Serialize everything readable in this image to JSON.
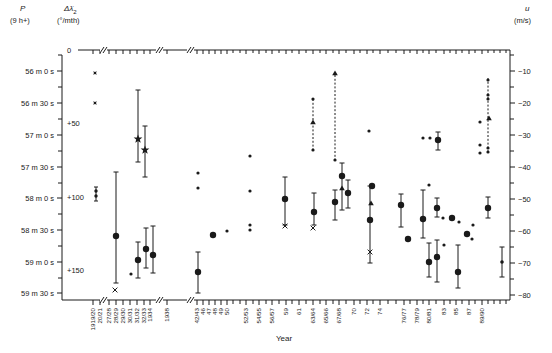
{
  "figure": {
    "width": 552,
    "height": 353,
    "background": "#ffffff",
    "ink": "#1a1a1a"
  },
  "header": {
    "p_title": "P",
    "p_sub": "(9 h+)",
    "dl_title": "Δλ̇",
    "dl_title_sub": "2",
    "dl_sub": "(°/mth)",
    "u_title": "u",
    "u_sub": "(m/s)"
  },
  "axes": {
    "frame": {
      "left_x": 62,
      "left_top_y": 55,
      "right_x": 510,
      "top_y": 50,
      "top_left_x": 78,
      "bottom_y": 300
    },
    "p": {
      "labels": [
        "56 m 0 s",
        "56 m 30 s",
        "57 m 0 s",
        "57 m 30 s",
        "58 m 0 s",
        "58 m 30 s",
        "59 m 0 s",
        "59 m 30 s"
      ],
      "ys": [
        71,
        103,
        135,
        167,
        198,
        230,
        262,
        293
      ],
      "minor_ys": [
        55,
        87,
        119,
        151,
        183,
        214,
        246,
        278
      ]
    },
    "dlambda": {
      "labels": [
        "0",
        "+50",
        "+100",
        "+150"
      ],
      "ys": [
        50,
        123,
        197,
        270
      ],
      "label_x": 67
    },
    "u": {
      "labels": [
        "−10",
        "−20",
        "−30",
        "−40",
        "−50",
        "−60",
        "−70",
        "−80"
      ],
      "ys": [
        71,
        103,
        135,
        167,
        199,
        231,
        263,
        295
      ],
      "minor_ys": [
        55,
        87,
        119,
        151,
        183,
        215,
        247,
        279
      ]
    },
    "x": {
      "title": "Year",
      "title_x": 284,
      "title_y": 341,
      "ticks": [
        {
          "x": 93,
          "l": "1919/20"
        },
        {
          "x": 100,
          "l": "20/21"
        },
        {
          "x": 109,
          "l": "27/28"
        },
        {
          "x": 116,
          "l": "28/29"
        },
        {
          "x": 123,
          "l": "29/30"
        },
        {
          "x": 130,
          "l": "30/31"
        },
        {
          "x": 137,
          "l": "31/32"
        },
        {
          "x": 144,
          "l": "32/33"
        },
        {
          "x": 150,
          "l": "1934"
        },
        {
          "x": 167,
          "l": "1938"
        },
        {
          "x": 197,
          "l": "42/43"
        },
        {
          "x": 203,
          "l": "46"
        },
        {
          "x": 209,
          "l": "47"
        },
        {
          "x": 215,
          "l": "48"
        },
        {
          "x": 221,
          "l": "49"
        },
        {
          "x": 227,
          "l": "50"
        },
        {
          "x": 246,
          "l": "52/53"
        },
        {
          "x": 259,
          "l": "54/55"
        },
        {
          "x": 272,
          "l": "56/57"
        },
        {
          "x": 286,
          "l": "59"
        },
        {
          "x": 299,
          "l": "61"
        },
        {
          "x": 313,
          "l": "63/64"
        },
        {
          "x": 326,
          "l": "65/66"
        },
        {
          "x": 339,
          "l": "67/68"
        },
        {
          "x": 354,
          "l": "70"
        },
        {
          "x": 367,
          "l": "72"
        },
        {
          "x": 380,
          "l": "74"
        },
        {
          "x": 404,
          "l": "76/77"
        },
        {
          "x": 417,
          "l": "78/79"
        },
        {
          "x": 429,
          "l": "80/81"
        },
        {
          "x": 444,
          "l": "83"
        },
        {
          "x": 456,
          "l": "85"
        },
        {
          "x": 469,
          "l": "87"
        },
        {
          "x": 482,
          "l": "89/90"
        }
      ],
      "minor_x": [
        233,
        240,
        253,
        266,
        279,
        292,
        306,
        320,
        333,
        346,
        360,
        373,
        388,
        396,
        410,
        423,
        436,
        450,
        462,
        475,
        488,
        494,
        500,
        506
      ],
      "breaks": [
        103,
        159,
        190
      ]
    }
  },
  "chart_data": {
    "type": "scatter",
    "title": "",
    "xlabel": "Year",
    "ylabel_left_1": "P (9 h+)",
    "ylabel_left_2": "Δλ̇2 (°/mth)",
    "ylabel_right": "u (m/s)",
    "grid": false,
    "legend": "none",
    "axis_calibration": {
      "u_axis": {
        "u_at_y71": -10,
        "u_at_y295": -80,
        "m_per_s_per_px": 0.3125
      },
      "p_axis": {
        "p_at_y71": "9h 56m 0s",
        "p_at_y293": "9h 59m 30s",
        "seconds_per_px": 0.9375
      },
      "dlambda_axis": {
        "val_at_y50": 0,
        "val_at_y270": 150
      }
    },
    "series": [
      {
        "name": "filled-circle-determinations",
        "marker": "circle",
        "points": [
          {
            "x": 116,
            "y": 236,
            "bar": [
              172,
              283
            ],
            "u_est": -62
          },
          {
            "x": 138,
            "y": 260,
            "bar": [
              242,
              278
            ],
            "u_est": -69
          },
          {
            "x": 146,
            "y": 249,
            "bar": [
              228,
              268
            ],
            "u_est": -66
          },
          {
            "x": 153,
            "y": 255,
            "bar": [
              226,
              273
            ],
            "u_est": -68
          },
          {
            "x": 198,
            "y": 272,
            "bar": [
              252,
              293
            ],
            "u_est": -73
          },
          {
            "x": 213,
            "y": 235,
            "bar": null,
            "u_est": -61
          },
          {
            "x": 285,
            "y": 199,
            "bar": [
              177,
              225
            ],
            "u_est": -50
          },
          {
            "x": 314,
            "y": 212,
            "bar": [
              193,
              225
            ],
            "u_est": -54
          },
          {
            "x": 335,
            "y": 202,
            "bar": [
              190,
              220
            ],
            "u_est": -51
          },
          {
            "x": 342,
            "y": 176,
            "bar": [
              163,
              210
            ],
            "u_est": -43
          },
          {
            "x": 348,
            "y": 193,
            "bar": [
              180,
              208
            ],
            "u_est": -48
          },
          {
            "x": 372,
            "y": 186,
            "bar": null,
            "u_est": -46
          },
          {
            "x": 370,
            "y": 220,
            "bar": [
              186,
              263
            ],
            "u_est": -57
          },
          {
            "x": 401,
            "y": 205,
            "bar": [
              194,
              227
            ],
            "u_est": -52
          },
          {
            "x": 408,
            "y": 239,
            "bar": null,
            "u_est": -63
          },
          {
            "x": 423,
            "y": 219,
            "bar": [
              190,
              238
            ],
            "u_est": -56
          },
          {
            "x": 437,
            "y": 208,
            "bar": [
              198,
              217
            ],
            "u_est": -53
          },
          {
            "x": 438,
            "y": 140,
            "bar": [
              132,
              150
            ],
            "u_est": -32
          },
          {
            "x": 429,
            "y": 262,
            "bar": [
              243,
              277
            ],
            "u_est": -70
          },
          {
            "x": 437,
            "y": 257,
            "bar": [
              240,
              282
            ],
            "u_est": -68
          },
          {
            "x": 452,
            "y": 218,
            "bar": null,
            "u_est": -56
          },
          {
            "x": 467,
            "y": 234,
            "bar": null,
            "u_est": -61
          },
          {
            "x": 458,
            "y": 272,
            "bar": [
              245,
              288
            ],
            "u_est": -73
          },
          {
            "x": 488,
            "y": 208,
            "bar": [
              197,
              218
            ],
            "u_est": -53
          },
          {
            "x": 502,
            "y": 262,
            "bar": [
              247,
              277
            ],
            "r": 1.8,
            "u_est": -70
          }
        ]
      },
      {
        "name": "large-star-determinations",
        "marker": "star5",
        "points": [
          {
            "x": 138,
            "y": 139,
            "bar": [
              90,
              162
            ],
            "u_est": -31
          },
          {
            "x": 145,
            "y": 150,
            "bar": [
              126,
              177
            ],
            "u_est": -35
          }
        ]
      },
      {
        "name": "small-star-points",
        "marker": "star4",
        "points": [
          {
            "x": 95,
            "y": 73,
            "u_est": -11
          },
          {
            "x": 95,
            "y": 103,
            "u_est": -20
          }
        ]
      },
      {
        "name": "small-dot-points",
        "marker": "dot",
        "points": [
          {
            "x": 131,
            "y": 274
          },
          {
            "x": 227,
            "y": 231
          },
          {
            "x": 198,
            "y": 173
          },
          {
            "x": 198,
            "y": 188
          },
          {
            "x": 250,
            "y": 156
          },
          {
            "x": 250,
            "y": 191
          },
          {
            "x": 250,
            "y": 225
          },
          {
            "x": 250,
            "y": 230
          },
          {
            "x": 369,
            "y": 131
          },
          {
            "x": 429,
            "y": 185
          },
          {
            "x": 443,
            "y": 218
          },
          {
            "x": 423,
            "y": 138
          },
          {
            "x": 430,
            "y": 138
          },
          {
            "x": 444,
            "y": 245
          },
          {
            "x": 459,
            "y": 222
          },
          {
            "x": 473,
            "y": 225
          },
          {
            "x": 472,
            "y": 239
          },
          {
            "x": 480,
            "y": 122
          },
          {
            "x": 480,
            "y": 145
          },
          {
            "x": 480,
            "y": 153
          },
          {
            "x": 313,
            "y": 99
          },
          {
            "x": 313,
            "y": 150
          },
          {
            "x": 335,
            "y": 160
          },
          {
            "x": 488,
            "y": 80
          },
          {
            "x": 488,
            "y": 95
          },
          {
            "x": 488,
            "y": 99
          },
          {
            "x": 488,
            "y": 148
          },
          {
            "x": 488,
            "y": 152
          }
        ]
      },
      {
        "name": "cross-points",
        "marker": "x",
        "points": [
          {
            "x": 115,
            "y": 290
          },
          {
            "x": 285,
            "y": 226
          },
          {
            "x": 313,
            "y": 228
          },
          {
            "x": 370,
            "y": 252
          }
        ]
      },
      {
        "name": "triangle-points",
        "marker": "triangle-up",
        "points": [
          {
            "x": 342,
            "y": 188
          },
          {
            "x": 371,
            "y": 203
          },
          {
            "x": 313,
            "y": 122
          },
          {
            "x": 335,
            "y": 73
          },
          {
            "x": 489,
            "y": 118
          }
        ]
      },
      {
        "name": "double-dot-point",
        "marker": "double-dot",
        "points": [
          {
            "x": 96,
            "dot_ys": [
              191,
              196
            ],
            "cap_ys": [
              187,
              201
            ]
          }
        ]
      },
      {
        "name": "dashed-uncertainty-arrows",
        "marker": "dashed-line",
        "elements": [
          {
            "x": 313,
            "y1": 99,
            "y2": 150
          },
          {
            "x": 335,
            "y1": 75,
            "y2": 160
          },
          {
            "x": 488,
            "y1": 78,
            "y2": 152
          }
        ]
      }
    ]
  }
}
